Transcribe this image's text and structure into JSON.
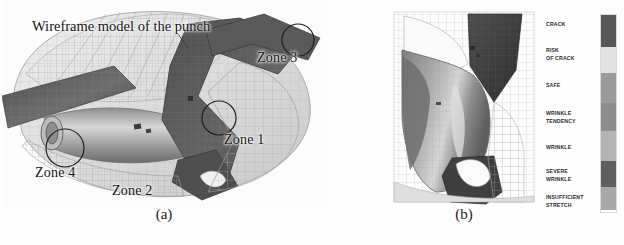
{
  "figure": {
    "type": "sheet-metal-forming-fem-result",
    "panels": [
      {
        "id": "a",
        "caption": "(a)",
        "annotation_title": "Wireframe model of the punch",
        "zones": [
          {
            "label": "Zone 1",
            "x": 222,
            "y": 140,
            "circle": {
              "cx": 217,
              "cy": 118,
              "r": 17
            }
          },
          {
            "label": "Zone 2",
            "x": 110,
            "y": 190,
            "circle": null
          },
          {
            "label": "Zone 3",
            "x": 255,
            "y": 58,
            "circle": {
              "cx": 296,
              "cy": 40,
              "r": 16
            }
          },
          {
            "label": "Zone 4",
            "x": 37,
            "y": 172,
            "circle": {
              "cx": 63,
              "cy": 148,
              "r": 19
            }
          }
        ]
      },
      {
        "id": "b",
        "caption": "(b)",
        "annotation_title": "",
        "zones": []
      }
    ]
  },
  "legend": {
    "name": "forming-limit-legend",
    "items": [
      {
        "lines": [
          "CRACK"
        ],
        "color": "#575757",
        "top": 15,
        "band_top": 2,
        "band_height": 32
      },
      {
        "lines": [
          "RISK",
          "OF CRACK"
        ],
        "color": "#e2e2e2",
        "top": 43,
        "band_top": 34,
        "band_height": 26
      },
      {
        "lines": [
          "SAFE"
        ],
        "color": "#9b9b9b",
        "top": 78,
        "band_top": 60,
        "band_height": 30
      },
      {
        "lines": [
          "WRINKLE",
          "TENDENCY"
        ],
        "color": "#8e8e8e",
        "top": 106,
        "band_top": 90,
        "band_height": 28
      },
      {
        "lines": [
          "WRINKLE"
        ],
        "color": "#b4b4b4",
        "top": 140,
        "band_top": 118,
        "band_height": 30
      },
      {
        "lines": [
          "SEVERE",
          "WRINKLE"
        ],
        "color": "#5f5f5f",
        "top": 163,
        "band_top": 148,
        "band_height": 26
      },
      {
        "lines": [
          "INSUFFICIENT",
          "STRETCH"
        ],
        "color": "#a8a8a8",
        "top": 190,
        "band_top": 174,
        "band_height": 23
      }
    ]
  },
  "chart_data": {
    "type": "heatmap",
    "xlabel": "",
    "ylabel": "",
    "categories": [
      "CRACK",
      "RISK OF CRACK",
      "SAFE",
      "WRINKLE TENDENCY",
      "WRINKLE",
      "SEVERE WRINKLE",
      "INSUFFICIENT STRETCH"
    ],
    "values": [
      1,
      2,
      3,
      4,
      5,
      6,
      7
    ],
    "colors": [
      "#575757",
      "#e2e2e2",
      "#9b9b9b",
      "#8e8e8e",
      "#b4b4b4",
      "#5f5f5f",
      "#a8a8a8"
    ],
    "legend_position": "right",
    "grid": false
  }
}
